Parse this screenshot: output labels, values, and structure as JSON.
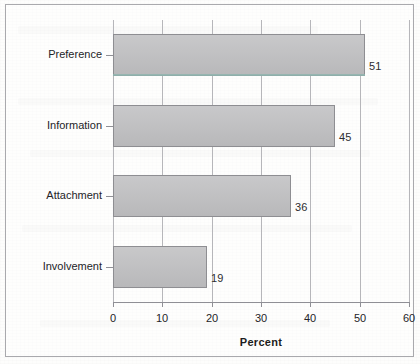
{
  "chart_data": {
    "type": "bar",
    "orientation": "horizontal",
    "title": "",
    "xlabel": "Percent",
    "ylabel": "Support Dimensions",
    "categories": [
      "Preference",
      "Information",
      "Attachment",
      "Involvement"
    ],
    "values": [
      51,
      45,
      36,
      19
    ],
    "value_labels": [
      "51",
      "45",
      "36",
      "19"
    ],
    "xlim": [
      0,
      60
    ],
    "xticks": [
      0,
      10,
      20,
      30,
      40,
      50,
      60
    ],
    "xtick_labels": [
      "0",
      "10",
      "20",
      "30",
      "40",
      "50",
      "60"
    ],
    "grid": "vertical",
    "legend": "none",
    "bar_fill_color": "#bebec0",
    "bar_border_color": "#8e8e92",
    "axis_color": "#8f8f95",
    "grid_color": "#b6b6ba",
    "text_color": "#242428",
    "frame_color": "#a9a9ad",
    "background_color": "#fdfdfc"
  }
}
